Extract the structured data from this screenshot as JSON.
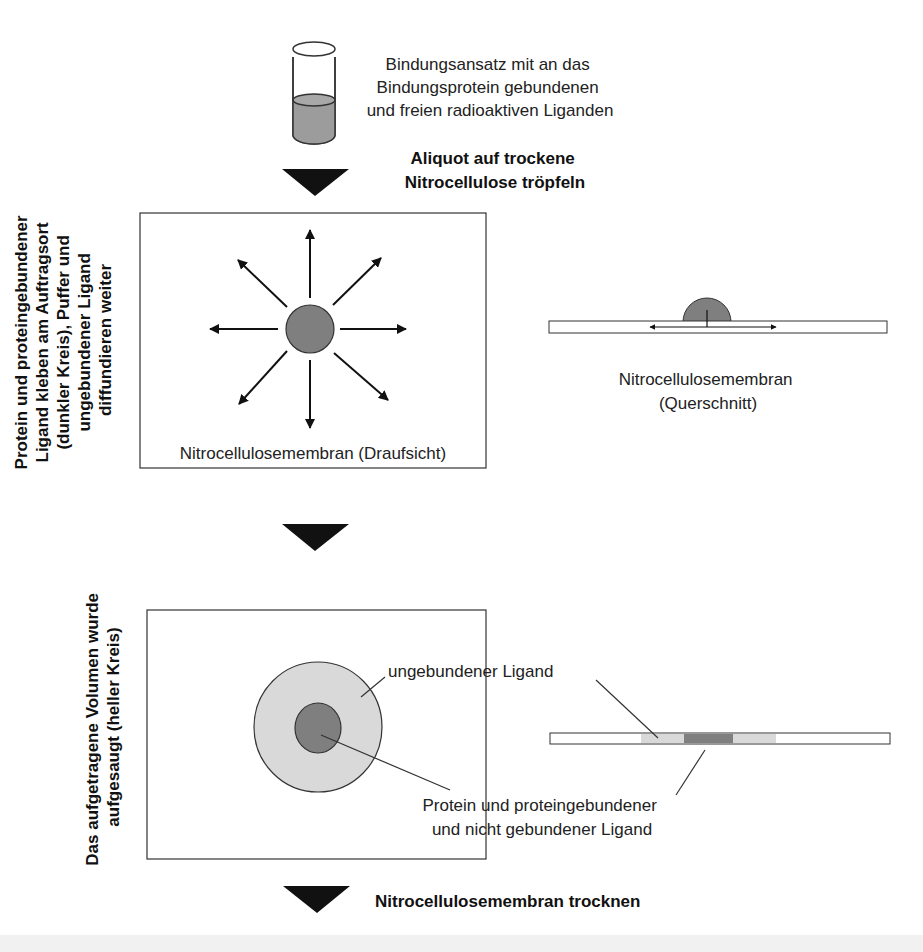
{
  "colors": {
    "dark_spot": "#7f7f7f",
    "light_spot": "#d9d9d9",
    "liquid": "#9c9c9c",
    "arrow": "#111111",
    "stroke": "#333333"
  },
  "step1": {
    "tube_label": [
      "Bindungsansatz mit an das",
      "Bindungsprotein gebundenen",
      "und freien radioaktiven Liganden"
    ],
    "action": [
      "Aliquot auf trockene",
      "Nitrocellulose tröpfeln"
    ]
  },
  "step2": {
    "side_label": [
      "Protein und proteingebundener",
      "Ligand kleben am Auftragsort",
      "(dunkler Kreis), Puffer und",
      "ungebundener Ligand",
      "diffundieren weiter"
    ],
    "top_view_caption": "Nitrocellulosemembran (Draufsicht)",
    "cross_section_caption": [
      "Nitrocellulosemembran",
      "(Querschnitt)"
    ]
  },
  "step3": {
    "side_label": [
      "Das aufgetragene Volumen wurde",
      "aufgesaugt (heller Kreis)"
    ],
    "callout_unbound": "ungebundener Ligand",
    "callout_bound": [
      "Protein und proteingebundener",
      "und nicht gebundener Ligand"
    ]
  },
  "step4": {
    "action": "Nitrocellulosemembran trocknen"
  }
}
